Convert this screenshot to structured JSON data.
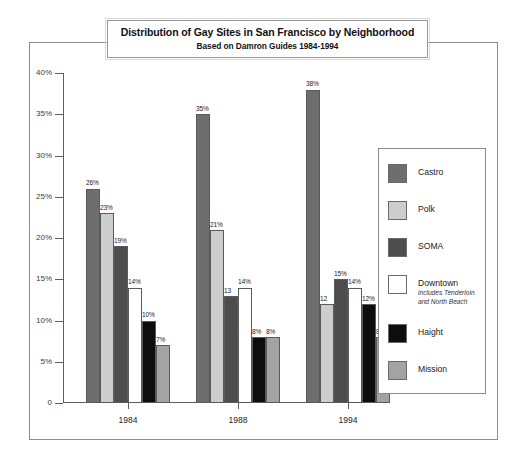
{
  "chart_data": {
    "type": "bar",
    "title": "Distribution of Gay Sites in San Francisco by Neighborhood",
    "subtitle": "Based on Damron Guides 1984-1994",
    "xlabel": "",
    "ylabel": "",
    "ylim": [
      0,
      40
    ],
    "grid": false,
    "legend_position": "right",
    "categories": [
      "1984",
      "1988",
      "1994"
    ],
    "yticks": [
      "0",
      "5%",
      "10%",
      "15%",
      "20%",
      "25%",
      "30%",
      "35%",
      "40%"
    ],
    "ytick_values": [
      0,
      5,
      10,
      15,
      20,
      25,
      30,
      35,
      40
    ],
    "series": [
      {
        "name": "Castro",
        "color": "#6e6e6e",
        "values": [
          26,
          35,
          38
        ],
        "labels": [
          "26%",
          "35%",
          "38%"
        ]
      },
      {
        "name": "Polk",
        "color": "#cdcdcd",
        "values": [
          23,
          21,
          12
        ],
        "labels": [
          "23%",
          "21%",
          "12"
        ]
      },
      {
        "name": "SOMA",
        "color": "#4d4d4d",
        "values": [
          19,
          13,
          15
        ],
        "labels": [
          "19%",
          "13",
          "15%"
        ]
      },
      {
        "name": "Downtown",
        "color": "#ffffff",
        "values": [
          14,
          14,
          14
        ],
        "labels": [
          "14%",
          "14%",
          "14%"
        ],
        "note": [
          "includes Tenderloin",
          "and North Beach"
        ]
      },
      {
        "name": "Haight",
        "color": "#0d0d0d",
        "values": [
          10,
          8,
          12
        ],
        "labels": [
          "10%",
          "8%",
          "12%"
        ]
      },
      {
        "name": "Mission",
        "color": "#a3a3a3",
        "values": [
          7,
          8,
          8
        ],
        "labels": [
          "7%",
          "8%",
          "8%"
        ]
      }
    ]
  }
}
